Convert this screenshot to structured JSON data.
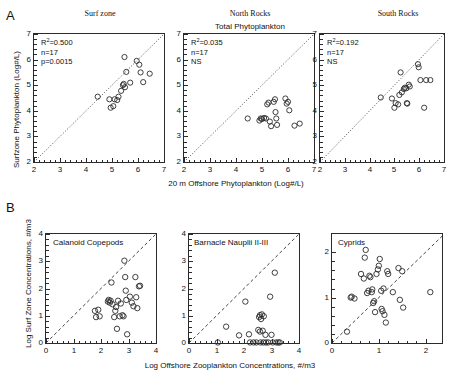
{
  "figure": {
    "sections": [
      {
        "letter": "A"
      },
      {
        "letter": "B"
      }
    ]
  },
  "panel_a": {
    "group_title": "Total Phytoplankton",
    "xlabel": "20 m Offshore Phytoplankton  (Log#/L)",
    "ylabel": "Surfzone Phytoplankton  (Log#/L)",
    "axis_ticks": [
      "2",
      "3",
      "4",
      "5",
      "6",
      "7"
    ],
    "panels": [
      {
        "title": "Surf zone",
        "r2_prefix": "R",
        "r2_sup": "2",
        "r2_value": "=0.500",
        "n": "n=17",
        "p": "p=0.0015"
      },
      {
        "title": "North Rocks",
        "r2_prefix": "R",
        "r2_sup": "2",
        "r2_value": "=0.035",
        "n": "n=17",
        "p": "NS"
      },
      {
        "title": "South Rocks",
        "r2_prefix": "R",
        "r2_sup": "2",
        "r2_value": "=0.192",
        "n": "n=17",
        "p": "NS"
      }
    ]
  },
  "panel_b": {
    "xlabel": "Log Offshore Zooplankton Concentrations, #/m3",
    "ylabel": "Log Surf Zone Concentrations, #/m3",
    "panels": [
      {
        "title": "Calanoid Copepods",
        "xticks": [
          "0",
          "1",
          "2",
          "3",
          "4"
        ],
        "yticks": [
          "0",
          "1",
          "2",
          "3",
          "4"
        ]
      },
      {
        "title": "Barnacle Nauplii II-III",
        "xticks": [
          "0",
          "1",
          "2",
          "3",
          "4"
        ],
        "yticks": [
          "0",
          "1",
          "2",
          "3",
          "4"
        ]
      },
      {
        "title": "Cyprids",
        "xticks": [
          "0",
          "1",
          "2"
        ],
        "yticks": [
          "0",
          "1",
          "2"
        ]
      }
    ]
  },
  "chart_data": [
    {
      "type": "scatter",
      "id": "a1",
      "title": "Surf zone",
      "subtitle": "Total Phytoplankton",
      "xlabel": "20 m Offshore Phytoplankton  (Log#/L)",
      "ylabel": "Surfzone Phytoplankton  (Log#/L)",
      "xlim": [
        2,
        7
      ],
      "ylim": [
        2,
        7
      ],
      "xticks": [
        2,
        3,
        4,
        5,
        6,
        7
      ],
      "yticks": [
        2,
        3,
        4,
        5,
        6,
        7
      ],
      "grid": false,
      "reference_line": {
        "style": "dotted",
        "from": [
          2,
          2
        ],
        "to": [
          7,
          7
        ],
        "label": "1:1"
      },
      "annotations": [
        "R2=0.500",
        "n=17",
        "p=0.0015"
      ],
      "stats": {
        "r_squared": 0.5,
        "n": 17,
        "p": 0.0015,
        "significant": true
      },
      "points": [
        [
          4.45,
          4.55
        ],
        [
          4.9,
          4.45
        ],
        [
          4.95,
          4.12
        ],
        [
          5.05,
          4.18
        ],
        [
          5.1,
          4.45
        ],
        [
          5.2,
          4.42
        ],
        [
          5.25,
          4.55
        ],
        [
          5.35,
          4.78
        ],
        [
          5.42,
          5.0
        ],
        [
          5.45,
          5.05
        ],
        [
          5.48,
          6.1
        ],
        [
          5.5,
          4.92
        ],
        [
          5.55,
          5.52
        ],
        [
          5.7,
          5.1
        ],
        [
          5.95,
          5.95
        ],
        [
          6.05,
          5.8
        ],
        [
          6.1,
          5.5
        ],
        [
          6.2,
          5.12
        ],
        [
          6.45,
          5.45
        ]
      ]
    },
    {
      "type": "scatter",
      "id": "a2",
      "title": "North Rocks",
      "subtitle": "Total Phytoplankton",
      "xlabel": "20 m Offshore Phytoplankton  (Log#/L)",
      "ylabel": "Surfzone Phytoplankton  (Log#/L)",
      "xlim": [
        2,
        7
      ],
      "ylim": [
        2,
        7
      ],
      "xticks": [
        2,
        3,
        4,
        5,
        6,
        7
      ],
      "yticks": [
        2,
        3,
        4,
        5,
        6,
        7
      ],
      "grid": false,
      "reference_line": {
        "style": "dotted",
        "from": [
          2,
          2
        ],
        "to": [
          7,
          7
        ],
        "label": "1:1"
      },
      "annotations": [
        "R2=0.035",
        "n=17",
        "NS"
      ],
      "stats": {
        "r_squared": 0.035,
        "n": 17,
        "p": null,
        "significant": false
      },
      "points": [
        [
          4.45,
          3.7
        ],
        [
          4.9,
          3.62
        ],
        [
          4.95,
          3.7
        ],
        [
          5.0,
          3.68
        ],
        [
          5.08,
          3.72
        ],
        [
          5.15,
          3.7
        ],
        [
          5.2,
          4.25
        ],
        [
          5.25,
          4.32
        ],
        [
          5.3,
          3.58
        ],
        [
          5.35,
          3.4
        ],
        [
          5.45,
          4.35
        ],
        [
          5.5,
          4.45
        ],
        [
          5.52,
          3.95
        ],
        [
          5.55,
          3.7
        ],
        [
          5.58,
          3.45
        ],
        [
          5.9,
          4.48
        ],
        [
          5.95,
          4.28
        ],
        [
          6.0,
          4.35
        ],
        [
          6.05,
          4.02
        ],
        [
          6.25,
          3.42
        ],
        [
          6.45,
          3.5
        ]
      ]
    },
    {
      "type": "scatter",
      "id": "a3",
      "title": "South Rocks",
      "subtitle": "Total Phytoplankton",
      "xlabel": "20 m Offshore Phytoplankton  (Log#/L)",
      "ylabel": "Surfzone Phytoplankton  (Log#/L)",
      "xlim": [
        2,
        7
      ],
      "ylim": [
        2,
        7
      ],
      "xticks": [
        2,
        3,
        4,
        5,
        6,
        7
      ],
      "yticks": [
        2,
        3,
        4,
        5,
        6,
        7
      ],
      "grid": false,
      "reference_line": {
        "style": "dotted",
        "from": [
          2,
          2
        ],
        "to": [
          7,
          7
        ],
        "label": "1:1"
      },
      "annotations": [
        "R2=0.192",
        "n=17",
        "NS"
      ],
      "stats": {
        "r_squared": 0.192,
        "n": 17,
        "p": null,
        "significant": false
      },
      "points": [
        [
          4.45,
          4.52
        ],
        [
          4.9,
          4.48
        ],
        [
          5.0,
          4.12
        ],
        [
          5.05,
          4.3
        ],
        [
          5.15,
          4.25
        ],
        [
          5.2,
          4.62
        ],
        [
          5.25,
          5.5
        ],
        [
          5.3,
          4.72
        ],
        [
          5.38,
          4.85
        ],
        [
          5.42,
          4.9
        ],
        [
          5.48,
          4.88
        ],
        [
          5.5,
          4.3
        ],
        [
          5.52,
          4.28
        ],
        [
          5.58,
          5.02
        ],
        [
          5.62,
          4.95
        ],
        [
          5.95,
          5.82
        ],
        [
          5.98,
          5.7
        ],
        [
          6.05,
          5.2
        ],
        [
          6.2,
          4.12
        ],
        [
          6.28,
          5.2
        ],
        [
          6.45,
          5.2
        ]
      ]
    },
    {
      "type": "scatter",
      "id": "b1",
      "title": "Calanoid Copepods",
      "xlabel": "Log Offshore Zooplankton Concentrations, #/m3",
      "ylabel": "Log Surf Zone Concentrations, #/m3",
      "xlim": [
        0,
        4
      ],
      "ylim": [
        0,
        4
      ],
      "xticks": [
        0,
        1,
        2,
        3,
        4
      ],
      "yticks": [
        0,
        1,
        2,
        3,
        4
      ],
      "grid": false,
      "reference_line": {
        "style": "dashed",
        "from": [
          0,
          0
        ],
        "to": [
          4,
          4
        ],
        "label": "1:1"
      },
      "points": [
        [
          1.78,
          1.18
        ],
        [
          1.82,
          0.95
        ],
        [
          1.9,
          1.22
        ],
        [
          1.95,
          0.98
        ],
        [
          2.25,
          1.52
        ],
        [
          2.28,
          1.58
        ],
        [
          2.32,
          1.48
        ],
        [
          2.35,
          1.55
        ],
        [
          2.38,
          2.22
        ],
        [
          2.42,
          1.42
        ],
        [
          2.48,
          0.95
        ],
        [
          2.52,
          1.18
        ],
        [
          2.55,
          1.32
        ],
        [
          2.58,
          0.52
        ],
        [
          2.62,
          1.55
        ],
        [
          2.68,
          0.98
        ],
        [
          2.72,
          1.45
        ],
        [
          2.78,
          1.02
        ],
        [
          2.82,
          0.98
        ],
        [
          2.85,
          3.02
        ],
        [
          2.88,
          2.42
        ],
        [
          2.9,
          1.92
        ],
        [
          2.92,
          1.58
        ],
        [
          2.95,
          0.32
        ],
        [
          3.05,
          1.7
        ],
        [
          3.12,
          1.48
        ],
        [
          3.18,
          1.35
        ],
        [
          3.25,
          2.42
        ],
        [
          3.28,
          1.68
        ],
        [
          3.32,
          1.28
        ],
        [
          3.38,
          2.08
        ],
        [
          3.42,
          2.1
        ]
      ]
    },
    {
      "type": "scatter",
      "id": "b2",
      "title": "Barnacle Nauplii II-III",
      "xlabel": "Log Offshore Zooplankton Concentrations, #/m3",
      "ylabel": "Log Surf Zone Concentrations, #/m3",
      "xlim": [
        0,
        4
      ],
      "ylim": [
        0,
        4
      ],
      "xticks": [
        0,
        1,
        2,
        3,
        4
      ],
      "yticks": [
        0,
        1,
        2,
        3,
        4
      ],
      "grid": false,
      "reference_line": {
        "style": "dashed",
        "from": [
          0,
          0
        ],
        "to": [
          4,
          4
        ],
        "label": "1:1"
      },
      "points": [
        [
          1.05,
          0.02
        ],
        [
          1.35,
          0.6
        ],
        [
          1.82,
          0.28
        ],
        [
          2.05,
          1.52
        ],
        [
          2.18,
          0.32
        ],
        [
          2.22,
          0.02
        ],
        [
          2.35,
          0.02
        ],
        [
          2.45,
          0.02
        ],
        [
          2.52,
          0.48
        ],
        [
          2.55,
          0.95
        ],
        [
          2.58,
          1.02
        ],
        [
          2.58,
          0.42
        ],
        [
          2.6,
          0.02
        ],
        [
          2.62,
          0.88
        ],
        [
          2.65,
          1.05
        ],
        [
          2.68,
          0.45
        ],
        [
          2.7,
          0.02
        ],
        [
          2.72,
          0.98
        ],
        [
          2.78,
          0.3
        ],
        [
          2.8,
          0.02
        ],
        [
          2.88,
          0.02
        ],
        [
          2.95,
          1.7
        ],
        [
          3.0,
          0.3
        ],
        [
          3.05,
          0.02
        ],
        [
          3.12,
          2.58
        ],
        [
          3.18,
          0.02
        ],
        [
          3.25,
          0.02
        ],
        [
          3.3,
          0.02
        ]
      ]
    },
    {
      "type": "scatter",
      "id": "b3",
      "title": "Cyprids",
      "xlabel": "Log Offshore Zooplankton Concentrations, #/m3",
      "ylabel": "Log Surf Zone Concentrations, #/m3",
      "xlim": [
        0,
        2.35
      ],
      "ylim": [
        0,
        2.4
      ],
      "xticks": [
        0,
        1,
        2
      ],
      "yticks": [
        0,
        1,
        2
      ],
      "grid": false,
      "reference_line": {
        "style": "dashed",
        "from": [
          0,
          0
        ],
        "to": [
          2.35,
          2.35
        ],
        "label": "1:1"
      },
      "points": [
        [
          0.32,
          0.25
        ],
        [
          0.4,
          1.0
        ],
        [
          0.42,
          1.02
        ],
        [
          0.48,
          0.98
        ],
        [
          0.62,
          1.52
        ],
        [
          0.68,
          1.42
        ],
        [
          0.7,
          1.88
        ],
        [
          0.72,
          2.05
        ],
        [
          0.75,
          1.1
        ],
        [
          0.78,
          1.15
        ],
        [
          0.8,
          1.48
        ],
        [
          0.82,
          1.45
        ],
        [
          0.85,
          1.12
        ],
        [
          0.86,
          1.18
        ],
        [
          0.88,
          0.88
        ],
        [
          0.9,
          0.92
        ],
        [
          0.92,
          0.68
        ],
        [
          0.95,
          1.52
        ],
        [
          0.98,
          1.62
        ],
        [
          1.0,
          1.7
        ],
        [
          1.02,
          1.85
        ],
        [
          1.05,
          1.15
        ],
        [
          1.06,
          0.75
        ],
        [
          1.08,
          0.7
        ],
        [
          1.1,
          1.2
        ],
        [
          1.12,
          0.62
        ],
        [
          1.15,
          0.45
        ],
        [
          1.18,
          1.58
        ],
        [
          1.2,
          1.52
        ],
        [
          1.3,
          1.12
        ],
        [
          1.42,
          1.65
        ],
        [
          1.45,
          0.95
        ],
        [
          1.5,
          1.58
        ],
        [
          1.52,
          0.78
        ],
        [
          2.1,
          1.12
        ]
      ]
    }
  ]
}
